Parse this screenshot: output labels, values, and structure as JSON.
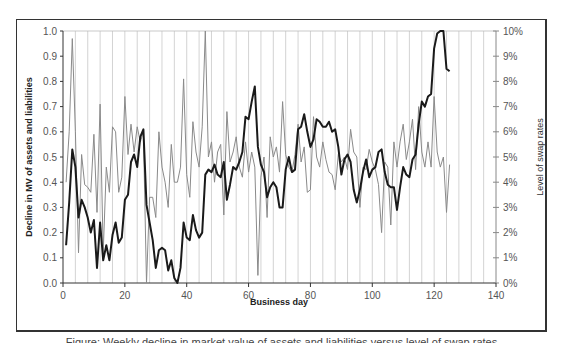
{
  "chart_data": {
    "type": "line",
    "title": "",
    "xlabel": "Business day",
    "ylabel": "Decline in MV of assets and liabilities",
    "y2label": "Level of swap rates",
    "xlim": [
      0,
      140
    ],
    "ylim": [
      0,
      1.0
    ],
    "y2lim": [
      0,
      10
    ],
    "x_ticks": [
      "0",
      "20",
      "40",
      "60",
      "80",
      "100",
      "120",
      "140"
    ],
    "y_ticks": [
      "0.0",
      "0.1",
      "0.2",
      "0.3",
      "0.4",
      "0.5",
      "0.6",
      "0.7",
      "0.8",
      "0.9",
      "1.0"
    ],
    "y2_ticks": [
      "0%",
      "1%",
      "2%",
      "3%",
      "4%",
      "5%",
      "6%",
      "7%",
      "8%",
      "9%",
      "10%"
    ],
    "grid": {
      "vertical": true,
      "every_x": 4,
      "horizontal": false
    },
    "legend": null,
    "series": [
      {
        "name": "Decline in MV of assets and liabilities",
        "axis": "left",
        "color": "#1a1a1a",
        "width": 2,
        "x_start": 1,
        "values": [
          0.15,
          0.32,
          0.53,
          0.46,
          0.26,
          0.33,
          0.3,
          0.26,
          0.2,
          0.25,
          0.06,
          0.24,
          0.09,
          0.15,
          0.09,
          0.19,
          0.24,
          0.16,
          0.18,
          0.33,
          0.35,
          0.48,
          0.51,
          0.46,
          0.58,
          0.61,
          0.31,
          0.24,
          0.17,
          0.06,
          0.13,
          0.14,
          0.13,
          0.05,
          0.09,
          0.02,
          0.0,
          0.06,
          0.24,
          0.18,
          0.17,
          0.27,
          0.21,
          0.18,
          0.2,
          0.43,
          0.45,
          0.44,
          0.47,
          0.43,
          0.42,
          0.48,
          0.33,
          0.39,
          0.46,
          0.45,
          0.48,
          0.52,
          0.66,
          0.65,
          0.72,
          0.78,
          0.54,
          0.47,
          0.44,
          0.34,
          0.38,
          0.4,
          0.38,
          0.3,
          0.3,
          0.45,
          0.5,
          0.44,
          0.45,
          0.61,
          0.62,
          0.67,
          0.6,
          0.54,
          0.57,
          0.65,
          0.64,
          0.62,
          0.62,
          0.64,
          0.6,
          0.61,
          0.54,
          0.43,
          0.49,
          0.51,
          0.48,
          0.37,
          0.32,
          0.37,
          0.44,
          0.49,
          0.42,
          0.45,
          0.46,
          0.52,
          0.53,
          0.44,
          0.39,
          0.38,
          0.38,
          0.29,
          0.38,
          0.46,
          0.43,
          0.42,
          0.49,
          0.51,
          0.63,
          0.72,
          0.7,
          0.74,
          0.75,
          0.93,
          0.99,
          1.0,
          1.0,
          0.85,
          0.84
        ]
      },
      {
        "name": "Level of swap rates",
        "axis": "right",
        "unit": "%",
        "color": "#8a8a8a",
        "width": 1,
        "x_start": 1,
        "values": [
          4.0,
          6.0,
          9.7,
          6.0,
          1.2,
          5.1,
          3.9,
          3.8,
          3.6,
          5.9,
          2.8,
          7.1,
          1.2,
          4.6,
          3.6,
          6.2,
          6.0,
          3.6,
          4.2,
          7.4,
          5.1,
          6.3,
          5.2,
          6.2,
          5.6,
          6.0,
          0.0,
          3.4,
          3.4,
          2.6,
          6.0,
          4.6,
          4.0,
          3.0,
          5.5,
          4.0,
          4.0,
          4.6,
          8.1,
          4.3,
          3.4,
          6.4,
          5.2,
          4.6,
          6.2,
          10.0,
          5.0,
          5.6,
          4.0,
          5.2,
          5.5,
          2.7,
          6.8,
          4.8,
          5.2,
          5.8,
          4.6,
          4.2,
          5.6,
          4.4,
          5.2,
          4.6,
          0.3,
          4.2,
          5.0,
          2.6,
          5.8,
          5.0,
          5.4,
          4.4,
          7.2,
          5.1,
          4.6,
          4.4,
          5.1,
          6.3,
          4.8,
          5.4,
          3.6,
          3.7,
          6.6,
          5.0,
          4.6,
          5.6,
          4.9,
          4.4,
          4.3,
          3.7,
          5.1,
          4.8,
          5.0,
          4.5,
          6.1,
          5.2,
          5.0,
          3.0,
          4.6,
          4.5,
          5.3,
          4.8,
          4.5,
          3.9,
          2.0,
          4.8,
          4.6,
          2.3,
          5.6,
          4.6,
          5.6,
          6.3,
          4.9,
          5.6,
          6.5,
          4.5,
          7.0,
          5.2,
          4.6,
          5.6,
          4.6,
          7.4,
          5.2,
          4.6,
          5.0,
          2.8,
          4.7
        ]
      }
    ]
  },
  "caption": "Figure: Weekly decline in market value of assets and liabilities versus level of swap rates"
}
